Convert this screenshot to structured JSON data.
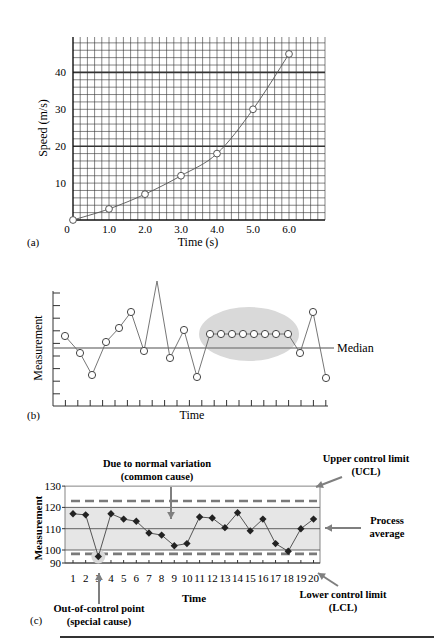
{
  "chart_data": [
    {
      "panel": "(a)",
      "type": "line",
      "xlabel": "Time (s)",
      "ylabel": "Speed (m/s)",
      "x_ticks": [
        "0",
        "1.0",
        "2.0",
        "3.0",
        "4.0",
        "5.0",
        "6.0"
      ],
      "y_ticks": [
        "10",
        "20",
        "30",
        "40"
      ],
      "xlim": [
        0,
        7
      ],
      "ylim": [
        0,
        50
      ],
      "grid": true,
      "x": [
        0,
        1,
        2,
        3,
        4,
        5,
        6
      ],
      "values": [
        0,
        3,
        7,
        12,
        18,
        30,
        45
      ]
    },
    {
      "panel": "(b)",
      "type": "line",
      "xlabel": "Time",
      "ylabel": "Measurement",
      "annotation": "Median",
      "highlight": "run of 8 consecutive points above median (shaded ellipse)",
      "values": [
        6.5,
        5.2,
        3.4,
        6.0,
        7.1,
        8.4,
        5.3,
        11.0,
        4.7,
        7.0,
        3.2,
        6.6,
        6.6,
        6.6,
        6.6,
        6.6,
        6.6,
        6.6,
        6.6,
        5.1,
        8.4,
        3.1
      ],
      "median": 5.6
    },
    {
      "panel": "(c)",
      "type": "line",
      "xlabel": "Time",
      "ylabel": "Measurement",
      "categories": [
        "1",
        "2",
        "3",
        "4",
        "5",
        "6",
        "7",
        "8",
        "9",
        "10",
        "11",
        "12",
        "13",
        "14",
        "15",
        "16",
        "17",
        "18",
        "19",
        "20"
      ],
      "y_ticks": [
        "90",
        "100",
        "110",
        "120",
        "130"
      ],
      "ylim": [
        90,
        130
      ],
      "values": [
        117,
        116.5,
        95,
        117,
        114.5,
        113.5,
        108,
        107,
        102,
        103,
        115.5,
        115,
        110.5,
        117.5,
        109,
        114.5,
        103,
        99,
        110,
        114.5
      ],
      "ucl": 123,
      "lcl": 97,
      "process_average": 110,
      "annotations": {
        "common_cause": "Due to normal variation (common cause)",
        "ucl": "Upper control limit (UCL)",
        "average": "Process average",
        "lcl": "Lower control limit (LCL)",
        "special_cause": "Out-of-control point (special cause)"
      }
    }
  ],
  "panel_a": {
    "label": "(a)",
    "xlabel": "Time (s)",
    "ylabel": "Speed (m/s)",
    "x_ticks": [
      "0",
      "1.0",
      "2.0",
      "3.0",
      "4.0",
      "5.0",
      "6.0"
    ],
    "y_ticks": [
      "10",
      "20",
      "30",
      "40"
    ]
  },
  "panel_b": {
    "label": "(b)",
    "xlabel": "Time",
    "ylabel": "Measurement",
    "median_label": "Median"
  },
  "panel_c": {
    "label": "(c)",
    "xlabel": "Time",
    "ylabel": "Measurement",
    "y_ticks": [
      "90",
      "100",
      "110",
      "120",
      "130"
    ],
    "x_ticks": [
      "1",
      "2",
      "3",
      "4",
      "5",
      "6",
      "7",
      "8",
      "9",
      "10",
      "11",
      "12",
      "13",
      "14",
      "15",
      "16",
      "17",
      "18",
      "19",
      "20"
    ],
    "common_cause_line1": "Due to normal variation",
    "common_cause_line2": "(common cause)",
    "ucl_line1": "Upper control limit",
    "ucl_line2": "(UCL)",
    "avg_line1": "Process",
    "avg_line2": "average",
    "lcl_line1": "Lower control limit",
    "lcl_line2": "(LCL)",
    "special_line1": "Out-of-control point",
    "special_line2": "(special cause)"
  },
  "colors": {
    "ink": "#222222",
    "grid": "#333333",
    "shade": "#e6e6e6",
    "ellipse": "#d9d9d9",
    "dash": "#7a7a7a",
    "arrow": "#7f7f7f"
  }
}
